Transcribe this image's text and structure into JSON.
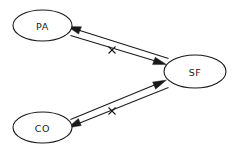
{
  "diagram": {
    "type": "path-diagram",
    "background_color": "#ffffff",
    "stroke_color": "#1a1a1a",
    "nodes": [
      {
        "id": "pa",
        "label": "PA",
        "shape": "ellipse",
        "cx": 42.5,
        "cy": 25.5,
        "rx": 29.5,
        "ry": 15.5
      },
      {
        "id": "sf",
        "label": "SF",
        "shape": "ellipse",
        "cx": 195,
        "cy": 71.5,
        "rx": 31,
        "ry": 16.5
      },
      {
        "id": "co",
        "label": "CO",
        "shape": "ellipse",
        "cx": 42.5,
        "cy": 127.5,
        "rx": 29.5,
        "ry": 15.5
      }
    ],
    "edges": [
      {
        "id": "pa-to-sf",
        "from": "pa",
        "to": "sf",
        "arrow_at": "sf",
        "blocked": true,
        "cross_marker": "x"
      },
      {
        "id": "sf-to-pa",
        "from": "sf",
        "to": "pa",
        "arrow_at": "pa",
        "blocked": true,
        "cross_marker": "x"
      },
      {
        "id": "co-to-sf",
        "from": "co",
        "to": "sf",
        "arrow_at": "sf",
        "blocked": true,
        "cross_marker": "x"
      },
      {
        "id": "sf-to-co",
        "from": "sf",
        "to": "co",
        "arrow_at": "co",
        "blocked": true,
        "cross_marker": "x"
      }
    ],
    "cross_marks": [
      {
        "id": "cross-upper",
        "x": 112,
        "y": 50,
        "label": "x"
      },
      {
        "id": "cross-lower",
        "x": 112,
        "y": 111,
        "label": "x"
      }
    ]
  }
}
